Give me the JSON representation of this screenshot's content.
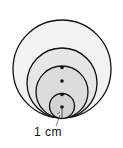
{
  "diagram": {
    "type": "nested tangent circles",
    "circles": [
      {
        "cx": 62,
        "cy": 69,
        "r": 49,
        "fill": "#f2f2f2"
      },
      {
        "cx": 62,
        "cy": 83,
        "r": 35,
        "fill": "#e6e6e6"
      },
      {
        "cx": 62,
        "cy": 92,
        "r": 26,
        "fill": "#dcdcdc"
      },
      {
        "cx": 62,
        "cy": 106,
        "r": 12.5,
        "fill": "#d2d2d2"
      }
    ],
    "dots": [
      {
        "cx": 62,
        "cy": 67
      },
      {
        "cx": 62,
        "cy": 81
      },
      {
        "cx": 62,
        "cy": 94
      },
      {
        "cx": 62,
        "cy": 107
      }
    ],
    "stroke_color": "#111111",
    "label": "1 cm"
  }
}
